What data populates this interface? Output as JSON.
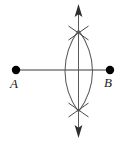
{
  "figure": {
    "background_color": "#ffffff",
    "stroke_color": "#3a3a3a",
    "point_color": "#000000",
    "width": 124,
    "height": 141
  },
  "points": {
    "left": {
      "label": "A",
      "x": 16,
      "y": 70,
      "radius": 4.2
    },
    "right": {
      "label": "B",
      "x": 110,
      "y": 70,
      "radius": 4.2
    }
  },
  "segment": {
    "name": "segment-AB",
    "x1": 16,
    "y1": 70,
    "x2": 110,
    "y2": 70
  },
  "bisector": {
    "name": "perpendicular-bisector",
    "x": 78.5,
    "y_top": 6,
    "y_bottom": 136,
    "arrow_top": true,
    "arrow_bottom": true
  },
  "arcs": [
    {
      "name": "arc-from-A",
      "center_x": 16,
      "center_y": 70,
      "bulge_x": 92,
      "start_y": 30,
      "end_y": 112
    },
    {
      "name": "arc-from-B",
      "center_x": 110,
      "center_y": 70,
      "bulge_x": 65,
      "start_y": 30,
      "end_y": 112
    }
  ],
  "tick_marks": {
    "top": {
      "name": "upper-intersection-ticks",
      "x": 78.5,
      "y": 32
    },
    "bottom": {
      "name": "lower-intersection-ticks",
      "x": 78.5,
      "y": 109
    }
  }
}
